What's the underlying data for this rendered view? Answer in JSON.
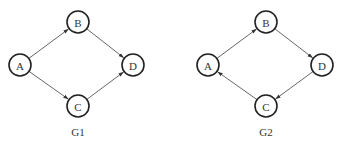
{
  "graphs": [
    {
      "name": "G1",
      "label": "G1",
      "nodes": [
        {
          "id": "A",
          "label": "A"
        },
        {
          "id": "B",
          "label": "B"
        },
        {
          "id": "C",
          "label": "C"
        },
        {
          "id": "D",
          "label": "D"
        }
      ],
      "edges": [
        {
          "from": "A",
          "to": "B"
        },
        {
          "from": "A",
          "to": "C"
        },
        {
          "from": "B",
          "to": "D"
        },
        {
          "from": "C",
          "to": "D"
        }
      ]
    },
    {
      "name": "G2",
      "label": "G2",
      "nodes": [
        {
          "id": "A",
          "label": "A"
        },
        {
          "id": "B",
          "label": "B"
        },
        {
          "id": "C",
          "label": "C"
        },
        {
          "id": "D",
          "label": "D"
        }
      ],
      "edges": [
        {
          "from": "A",
          "to": "B"
        },
        {
          "from": "B",
          "to": "D"
        },
        {
          "from": "D",
          "to": "C"
        },
        {
          "from": "C",
          "to": "A"
        }
      ]
    }
  ]
}
